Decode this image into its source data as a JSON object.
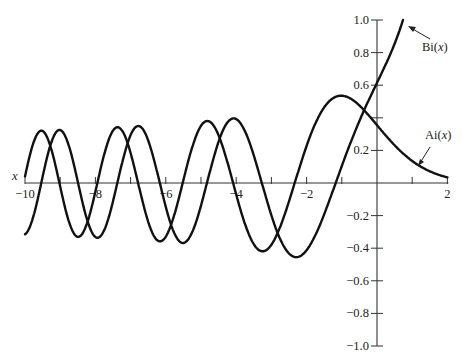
{
  "chart_data": {
    "type": "line",
    "title": "",
    "xlabel": "x",
    "ylabel": "",
    "xlim": [
      -10,
      2
    ],
    "ylim": [
      -1.0,
      1.0
    ],
    "grid": false,
    "x_ticks": [
      -10,
      -9,
      -8,
      -7,
      -6,
      -5,
      -4,
      -3,
      -2,
      -1,
      0,
      1,
      2
    ],
    "x_tick_labels": [
      {
        "value": -10,
        "label": "−10"
      },
      {
        "value": -8,
        "label": "−8"
      },
      {
        "value": -6,
        "label": "−6"
      },
      {
        "value": -4,
        "label": "−4"
      },
      {
        "value": -2,
        "label": "−2"
      },
      {
        "value": 2,
        "label": "2"
      }
    ],
    "y_ticks": [
      -1.0,
      -0.8,
      -0.6,
      -0.4,
      -0.2,
      0.2,
      0.4,
      0.6,
      0.8,
      1.0
    ],
    "y_tick_labels": [
      {
        "value": 1.0,
        "label": "1.0"
      },
      {
        "value": 0.8,
        "label": "0.8"
      },
      {
        "value": 0.6,
        "label": "0.6"
      },
      {
        "value": 0.2,
        "label": "0.2"
      },
      {
        "value": -0.2,
        "label": "−0.2"
      },
      {
        "value": -0.4,
        "label": "−0.4"
      },
      {
        "value": -0.6,
        "label": "−0.6"
      },
      {
        "value": -0.8,
        "label": "−0.8"
      },
      {
        "value": -1.0,
        "label": "−1.0"
      }
    ],
    "x": [
      -10,
      -9,
      -8,
      -7,
      -6,
      -5,
      -4,
      -3,
      -2,
      -1,
      0,
      1,
      2
    ],
    "series": [
      {
        "name": "Ai(x)",
        "values": [
          0.0424,
          -0.0222,
          -0.0527,
          0.1843,
          -0.3292,
          0.3508,
          -0.0702,
          -0.3788,
          0.2274,
          0.5356,
          0.355,
          0.1353,
          0.0349
        ]
      },
      {
        "name": "Bi(x)",
        "values": [
          -0.3147,
          0.3206,
          -0.3313,
          0.2938,
          -0.1467,
          -0.1384,
          0.3922,
          -0.1982,
          -0.4123,
          0.104,
          0.6149,
          1.2074,
          3.2981
        ]
      }
    ],
    "annotations": [
      {
        "text": "Bi(x)",
        "points_to": "Bi curve near x=0.8, y=0.95"
      },
      {
        "text": "Ai(x)",
        "points_to": "Ai curve near x=1.3, y=0.1"
      }
    ]
  },
  "labels": {
    "x_axis": "x",
    "bi_name": "Bi(",
    "ai_name": "Ai(",
    "var": "x",
    "close": ")"
  }
}
